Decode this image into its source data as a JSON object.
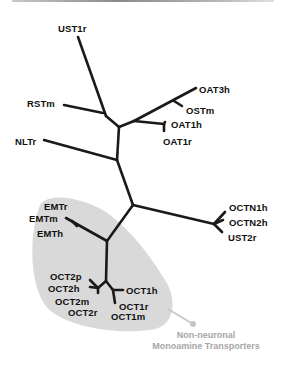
{
  "diagram": {
    "type": "unrooted-phylogenetic-tree",
    "colors": {
      "branch": "#1a1a1a",
      "group_fill": "#d9d9d9",
      "group_caption": "#a6a6a6",
      "label": "#111111"
    },
    "labels": {
      "UST1r": "UST1r",
      "RSTm": "RSTm",
      "OAT3h": "OAT3h",
      "OSTm": "OSTm",
      "OAT1h": "OAT1h",
      "OAT1r": "OAT1r",
      "NLTr": "NLTr",
      "EMTr": "EMTr",
      "EMTm": "EMTm",
      "EMTh": "EMTh",
      "OCTN1h": "OCTN1h",
      "OCTN2h": "OCTN2h",
      "UST2r": "UST2r",
      "OCT2p": "OCT2p",
      "OCT2h": "OCT2h",
      "OCT2m": "OCT2m",
      "OCT2r": "OCT2r",
      "OCT1h": "OCT1h",
      "OCT1r": "OCT1r",
      "OCT1m": "OCT1m"
    },
    "group": {
      "caption_line1": "Non-neuronal",
      "caption_line2": "Monoamine Transporters",
      "members": [
        "EMTr",
        "EMTm",
        "EMTh",
        "OCT2p",
        "OCT2h",
        "OCT2m",
        "OCT2r",
        "OCT1h",
        "OCT1r",
        "OCT1m"
      ]
    }
  }
}
